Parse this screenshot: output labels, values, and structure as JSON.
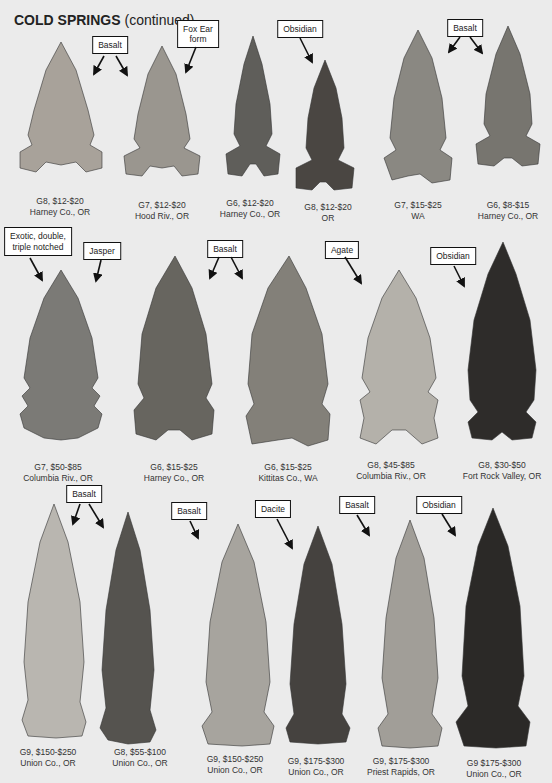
{
  "page": {
    "title": "COLD SPRINGS",
    "title_suffix": "(continued)"
  },
  "rows": [
    {
      "points": [
        {
          "grade_price": "G8, $12-$20",
          "location": "Harney Co., OR",
          "color": "#a8a29a"
        },
        {
          "grade_price": "G7, $12-$20",
          "location": "Hood Riv., OR",
          "color": "#9a968f"
        },
        {
          "grade_price": "G6, $12-$20",
          "location": "Harney Co., OR",
          "color": "#5f5e5a"
        },
        {
          "grade_price": "G8, $12-$20",
          "location": "OR",
          "color": "#4a4642"
        },
        {
          "grade_price": "G7, $15-$25",
          "location": "WA",
          "color": "#8a8882"
        },
        {
          "grade_price": "G6, $8-$15",
          "location": "Harney Co., OR",
          "color": "#77756f"
        }
      ],
      "labels": [
        {
          "text": "Basalt"
        },
        {
          "text": "Fox Ear\nform"
        },
        {
          "text": "Obsidian"
        },
        {
          "text": "Basalt"
        }
      ]
    },
    {
      "points": [
        {
          "grade_price": "G7, $50-$85",
          "location": "Columbia Riv., OR",
          "color": "#7b7a76"
        },
        {
          "grade_price": "G6, $15-$25",
          "location": "Harney Co., OR",
          "color": "#67655f"
        },
        {
          "grade_price": "G6, $15-$25",
          "location": "Kittitas Co., WA",
          "color": "#838079"
        },
        {
          "grade_price": "G8, $45-$85",
          "location": "Columbia Riv., OR",
          "color": "#b4b1aa"
        },
        {
          "grade_price": "G8, $30-$50",
          "location": "Fort Rock Valley, OR",
          "color": "#2e2c2a"
        }
      ],
      "labels": [
        {
          "text": "Exotic, double,\ntriple notched"
        },
        {
          "text": "Jasper"
        },
        {
          "text": "Basalt"
        },
        {
          "text": "Agate"
        },
        {
          "text": "Obsidian"
        }
      ]
    },
    {
      "points": [
        {
          "grade_price": "G9, $150-$250",
          "location": "Union Co., OR",
          "color": "#b9b6b0"
        },
        {
          "grade_price": "G8, $55-$100",
          "location": "Union Co., OR",
          "color": "#55534f"
        },
        {
          "grade_price": "G9, $150-$250",
          "location": "Union Co., OR",
          "color": "#a7a49e"
        },
        {
          "grade_price": "G9, $175-$300",
          "location": "Union Co., OR",
          "color": "#45423f"
        },
        {
          "grade_price": "G9, $175-$300",
          "location": "Priest Rapids, OR",
          "color": "#a19e98"
        },
        {
          "grade_price": "G9 $175-$300",
          "location": "Union Co., OR",
          "color": "#2b2927"
        }
      ],
      "labels": [
        {
          "text": "Basalt"
        },
        {
          "text": "Basalt"
        },
        {
          "text": "Dacite"
        },
        {
          "text": "Basalt"
        },
        {
          "text": "Obsidian"
        }
      ]
    }
  ]
}
